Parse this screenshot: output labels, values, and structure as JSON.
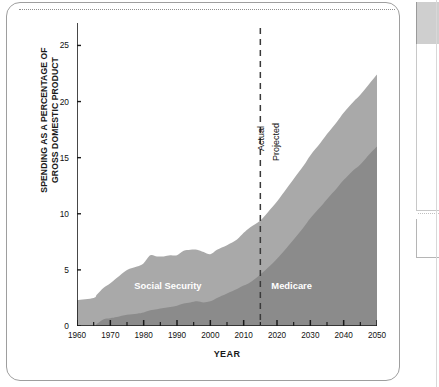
{
  "chart_data": {
    "type": "area",
    "title": "",
    "xlabel": "YEAR",
    "ylabel": "SPENDING AS A PERCENTAGE OF GROSS DOMESTIC PRODUCT",
    "xlim": [
      1960,
      2050
    ],
    "ylim": [
      0,
      27
    ],
    "grid": false,
    "legend_position": "inline-labels",
    "stacked": true,
    "y_ticks": [
      0,
      5,
      10,
      15,
      20,
      25
    ],
    "y_tick_labels": [
      "0",
      "5",
      "10",
      "15",
      "20",
      "25"
    ],
    "x_ticks": [
      1960,
      1970,
      1980,
      1990,
      2000,
      2010,
      2020,
      2030,
      2040,
      2050
    ],
    "x_tick_labels": [
      "1960",
      "1970",
      "1980",
      "1990",
      "2000",
      "2010",
      "2020",
      "2030",
      "2040",
      "2050"
    ],
    "x_minor_tick_step": 5,
    "colors": {
      "social_security": "#a9a9a9",
      "medicare": "#8b8b8b",
      "axis": "#1a1a1a",
      "divider": "#3a3a3a",
      "series_label_text": "#ffffff"
    },
    "annotations": [
      {
        "name": "divider-actual-projected",
        "x": 2015,
        "style": "dashed-vertical",
        "label_left": "Actual",
        "label_right": "Projected"
      }
    ],
    "series": [
      {
        "name": "Medicare",
        "label": "Medicare",
        "color": "#8b8b8b",
        "x": [
          1960,
          1965,
          1966,
          1968,
          1970,
          1972,
          1975,
          1978,
          1980,
          1982,
          1984,
          1986,
          1988,
          1990,
          1992,
          1994,
          1996,
          1998,
          2000,
          2002,
          2005,
          2008,
          2010,
          2012,
          2015,
          2018,
          2020,
          2023,
          2025,
          2028,
          2030,
          2033,
          2035,
          2038,
          2040,
          2043,
          2045,
          2048,
          2050
        ],
        "values": [
          0,
          0,
          0.2,
          0.6,
          0.7,
          0.8,
          1.0,
          1.1,
          1.2,
          1.4,
          1.5,
          1.6,
          1.7,
          1.8,
          2.0,
          2.1,
          2.2,
          2.1,
          2.2,
          2.5,
          2.9,
          3.3,
          3.6,
          3.9,
          4.6,
          5.4,
          6.0,
          7.0,
          7.7,
          8.8,
          9.6,
          10.6,
          11.3,
          12.3,
          13.0,
          13.9,
          14.4,
          15.4,
          16.0
        ]
      },
      {
        "name": "Social Security",
        "label": "Social Security",
        "color": "#a9a9a9",
        "x": [
          1960,
          1965,
          1966,
          1968,
          1970,
          1972,
          1975,
          1978,
          1980,
          1982,
          1984,
          1986,
          1988,
          1990,
          1992,
          1994,
          1996,
          1998,
          2000,
          2002,
          2005,
          2008,
          2010,
          2012,
          2015,
          2018,
          2020,
          2023,
          2025,
          2028,
          2030,
          2033,
          2035,
          2038,
          2040,
          2043,
          2045,
          2048,
          2050
        ],
        "values": [
          2.3,
          2.5,
          2.6,
          2.8,
          3.1,
          3.5,
          4.0,
          4.2,
          4.4,
          4.9,
          4.7,
          4.6,
          4.6,
          4.5,
          4.7,
          4.7,
          4.6,
          4.5,
          4.2,
          4.3,
          4.3,
          4.4,
          4.7,
          4.9,
          4.8,
          5.0,
          5.1,
          5.3,
          5.4,
          5.5,
          5.6,
          5.7,
          5.8,
          5.9,
          6.0,
          6.1,
          6.2,
          6.3,
          6.4
        ]
      }
    ],
    "totals": {
      "name": "Total spending",
      "values": [
        2.3,
        2.5,
        2.8,
        3.4,
        3.8,
        4.3,
        5.0,
        5.3,
        5.6,
        6.3,
        6.2,
        6.2,
        6.3,
        6.3,
        6.7,
        6.8,
        6.8,
        6.6,
        6.4,
        6.8,
        7.2,
        7.7,
        8.3,
        8.8,
        9.4,
        10.4,
        11.1,
        12.3,
        13.1,
        14.3,
        15.2,
        16.3,
        17.1,
        18.2,
        19.0,
        20.0,
        20.6,
        21.7,
        22.4
      ]
    }
  },
  "divider": {
    "actual_label": "Actual",
    "projected_label": "Projected"
  },
  "axis": {
    "x_title": "YEAR",
    "y_title_line1": "SPENDING AS A PERCENTAGE OF",
    "y_title_line2": "GROSS DOMESTIC PRODUCT"
  }
}
